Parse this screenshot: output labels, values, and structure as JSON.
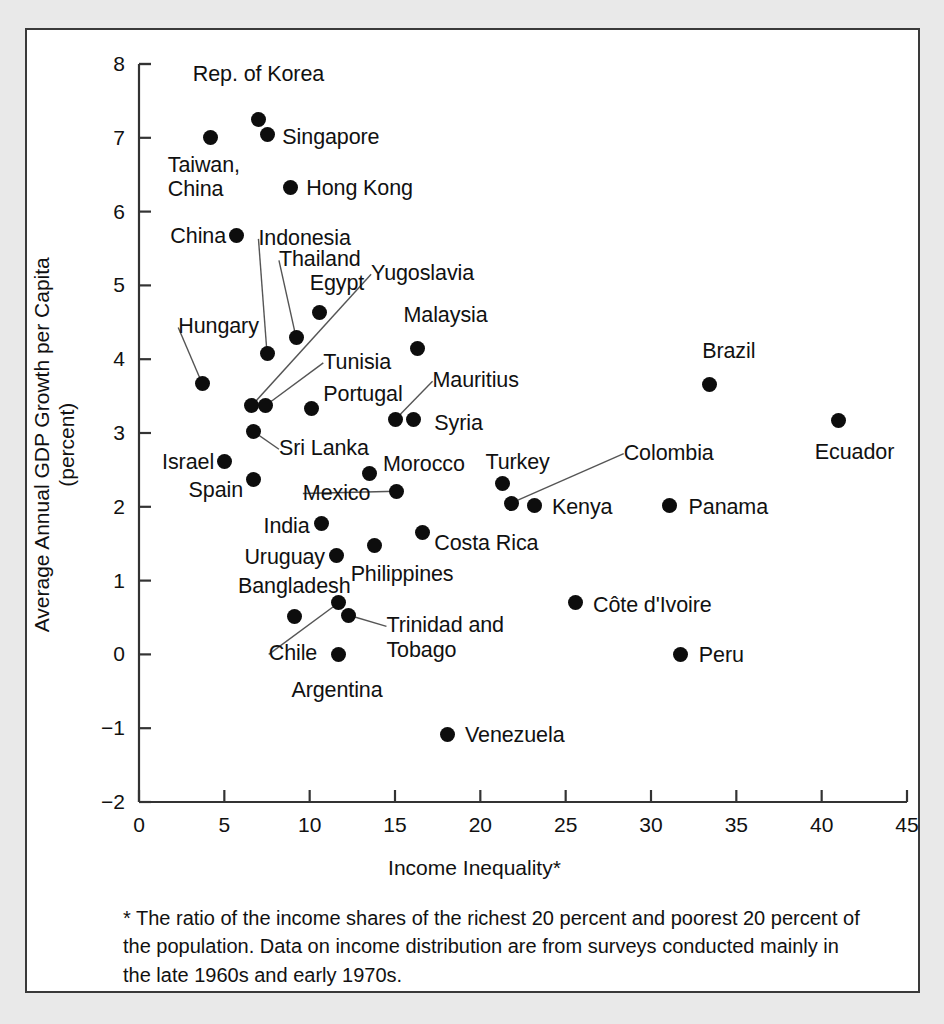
{
  "figure": {
    "panel_bg": "#ffffff",
    "outer_bg": "#e9e9e9",
    "border_color": "#3a3a3a",
    "marker_color": "#0d0d0d",
    "leader_color": "#555555"
  },
  "footnote": "* The ratio of the income shares of the richest 20 percent and poorest 20 percent of the population. Data on income distribution are from surveys conducted mainly in the late 1960s and early 1970s.",
  "chart_data": {
    "type": "scatter",
    "title": "",
    "xlabel": "Income Inequality*",
    "ylabel": "Average Annual GDP Growth per Capita\n(percent)",
    "ylabel_line1": "Average Annual GDP Growth per Capita",
    "ylabel_line2": "(percent)",
    "xlim": [
      0,
      45
    ],
    "ylim": [
      -2,
      8
    ],
    "xticks": [
      0,
      5,
      10,
      15,
      20,
      25,
      30,
      35,
      40,
      45
    ],
    "yticks": [
      -2,
      -1,
      0,
      1,
      2,
      3,
      4,
      5,
      6,
      7,
      8
    ],
    "xtick_labels": [
      "0",
      "5",
      "10",
      "15",
      "20",
      "25",
      "30",
      "35",
      "40",
      "45"
    ],
    "ytick_labels": [
      "−2",
      "−1",
      "0",
      "1",
      "2",
      "3",
      "4",
      "5",
      "6",
      "7",
      "8"
    ],
    "grid": false,
    "legend": "none",
    "points": [
      {
        "name": "Rep. of Korea",
        "x": 7.0,
        "y": 7.25,
        "label_x": 7.0,
        "label_y": 7.85,
        "label_align": "center",
        "leader": false
      },
      {
        "name": "Singapore",
        "x": 7.5,
        "y": 7.05,
        "label_x": 8.4,
        "label_y": 7.0,
        "label_align": "left",
        "leader": false
      },
      {
        "name": "Taiwan,\nChina",
        "x": 4.2,
        "y": 7.0,
        "label_x": 3.8,
        "label_y": 6.62,
        "label_align": "center",
        "leader": false,
        "lines": [
          "Taiwan,",
          "China"
        ]
      },
      {
        "name": "Hong Kong",
        "x": 8.9,
        "y": 6.33,
        "label_x": 9.8,
        "label_y": 6.3,
        "label_align": "left",
        "leader": false
      },
      {
        "name": "China",
        "x": 5.7,
        "y": 5.67,
        "label_x": 5.1,
        "label_y": 5.66,
        "label_align": "right",
        "leader": false
      },
      {
        "name": "Indonesia",
        "x": 7.5,
        "y": 4.08,
        "label_x": 7.0,
        "label_y": 5.63,
        "label_align": "left",
        "leader": true
      },
      {
        "name": "Thailand",
        "x": 9.2,
        "y": 4.3,
        "label_x": 8.2,
        "label_y": 5.34,
        "label_align": "left",
        "leader": true
      },
      {
        "name": "Egypt",
        "x": 10.6,
        "y": 4.63,
        "label_x": 10.0,
        "label_y": 5.02,
        "label_align": "left",
        "leader": false
      },
      {
        "name": "Yugoslavia",
        "x": 6.6,
        "y": 3.37,
        "label_x": 13.6,
        "label_y": 5.15,
        "label_align": "left",
        "leader": true
      },
      {
        "name": "Malaysia",
        "x": 16.3,
        "y": 4.15,
        "label_x": 15.5,
        "label_y": 4.58,
        "label_align": "left",
        "leader": false
      },
      {
        "name": "Hungary",
        "x": 3.7,
        "y": 3.67,
        "label_x": 2.3,
        "label_y": 4.43,
        "label_align": "left",
        "leader": true
      },
      {
        "name": "Tunisia",
        "x": 7.4,
        "y": 3.37,
        "label_x": 10.8,
        "label_y": 3.95,
        "label_align": "left",
        "leader": true
      },
      {
        "name": "Brazil",
        "x": 33.4,
        "y": 3.66,
        "label_x": 33.0,
        "label_y": 4.1,
        "label_align": "left",
        "leader": false
      },
      {
        "name": "Mauritius",
        "x": 15.0,
        "y": 3.18,
        "label_x": 17.2,
        "label_y": 3.7,
        "label_align": "left",
        "leader": true
      },
      {
        "name": "Portugal",
        "x": 10.1,
        "y": 3.33,
        "label_x": 10.8,
        "label_y": 3.52,
        "label_align": "left",
        "leader": false
      },
      {
        "name": "Ecuador",
        "x": 41.0,
        "y": 3.17,
        "label_x": 39.6,
        "label_y": 2.73,
        "label_align": "left",
        "leader": false
      },
      {
        "name": "Syria",
        "x": 16.1,
        "y": 3.18,
        "label_x": 17.3,
        "label_y": 3.12,
        "label_align": "left",
        "leader": false
      },
      {
        "name": "Sri Lanka",
        "x": 6.7,
        "y": 3.02,
        "label_x": 8.2,
        "label_y": 2.78,
        "label_align": "left",
        "leader": true
      },
      {
        "name": "Colombia",
        "x": 21.8,
        "y": 2.05,
        "label_x": 28.4,
        "label_y": 2.72,
        "label_align": "left",
        "leader": true
      },
      {
        "name": "Israel",
        "x": 5.0,
        "y": 2.62,
        "label_x": 4.4,
        "label_y": 2.6,
        "label_align": "right",
        "leader": false
      },
      {
        "name": "Morocco",
        "x": 13.5,
        "y": 2.45,
        "label_x": 14.3,
        "label_y": 2.56,
        "label_align": "left",
        "leader": false
      },
      {
        "name": "Turkey",
        "x": 21.3,
        "y": 2.32,
        "label_x": 20.3,
        "label_y": 2.6,
        "label_align": "left",
        "leader": false
      },
      {
        "name": "Spain",
        "x": 6.7,
        "y": 2.37,
        "label_x": 6.1,
        "label_y": 2.22,
        "label_align": "right",
        "leader": false
      },
      {
        "name": "Mexico",
        "x": 15.1,
        "y": 2.21,
        "label_x": 9.6,
        "label_y": 2.18,
        "label_align": "left",
        "leader": true
      },
      {
        "name": "Kenya",
        "x": 23.2,
        "y": 2.02,
        "label_x": 24.2,
        "label_y": 1.98,
        "label_align": "left",
        "leader": false
      },
      {
        "name": "Panama",
        "x": 31.1,
        "y": 2.02,
        "label_x": 32.2,
        "label_y": 1.99,
        "label_align": "left",
        "leader": false
      },
      {
        "name": "India",
        "x": 10.7,
        "y": 1.78,
        "label_x": 10.0,
        "label_y": 1.73,
        "label_align": "right",
        "leader": false
      },
      {
        "name": "Costa Rica",
        "x": 16.6,
        "y": 1.65,
        "label_x": 17.3,
        "label_y": 1.5,
        "label_align": "left",
        "leader": false
      },
      {
        "name": "Philippines",
        "x": 13.8,
        "y": 1.48,
        "label_x": 12.4,
        "label_y": 1.08,
        "label_align": "left",
        "leader": false
      },
      {
        "name": "Uruguay",
        "x": 11.6,
        "y": 1.34,
        "label_x": 10.9,
        "label_y": 1.3,
        "label_align": "right",
        "leader": false
      },
      {
        "name": "Côte d'Ivoire",
        "x": 25.6,
        "y": 0.7,
        "label_x": 26.6,
        "label_y": 0.66,
        "label_align": "left",
        "leader": false
      },
      {
        "name": "Chile",
        "x": 11.7,
        "y": 0.7,
        "label_x": 7.6,
        "label_y": 0.0,
        "label_align": "left",
        "leader": true
      },
      {
        "name": "Bangladesh",
        "x": 9.1,
        "y": 0.52,
        "label_x": 9.1,
        "label_y": 0.92,
        "label_align": "center",
        "leader": false
      },
      {
        "name": "Trinidad and\nTobago",
        "x": 12.3,
        "y": 0.53,
        "label_x": 14.5,
        "label_y": 0.38,
        "label_align": "left",
        "leader": true,
        "lines": [
          "Trinidad and",
          "Tobago"
        ]
      },
      {
        "name": "Peru",
        "x": 31.7,
        "y": 0.0,
        "label_x": 32.8,
        "label_y": -0.02,
        "label_align": "left",
        "leader": false
      },
      {
        "name": "Argentina",
        "x": 11.7,
        "y": 0.0,
        "label_x": 11.6,
        "label_y": -0.5,
        "label_align": "center",
        "leader": false
      },
      {
        "name": "Venezuela",
        "x": 18.1,
        "y": -1.08,
        "label_x": 19.1,
        "label_y": -1.1,
        "label_align": "left",
        "leader": false
      }
    ]
  }
}
